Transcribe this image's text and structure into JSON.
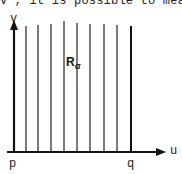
{
  "top_text": "v , it is possible to mea",
  "diagram": {
    "axes": {
      "x_label": "u",
      "y_label": "v"
    },
    "points": {
      "left": "p",
      "right": "q"
    },
    "region": {
      "label": "R",
      "subscript": "σ"
    },
    "vertical_lines_x": [
      26,
      38,
      51,
      64,
      77,
      90,
      104,
      117,
      131
    ]
  }
}
